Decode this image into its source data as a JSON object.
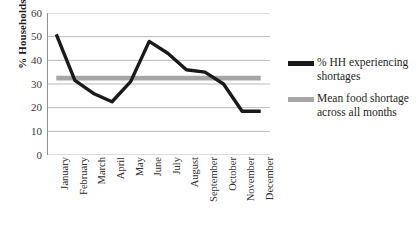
{
  "chart_data": {
    "type": "line",
    "title": "",
    "xlabel": "",
    "ylabel": "% Households",
    "ylim": [
      0,
      60
    ],
    "ytick_step": 10,
    "yticks": [
      60,
      50,
      40,
      30,
      20,
      10,
      0
    ],
    "grid": true,
    "legend_position": "right",
    "categories": [
      "January",
      "February",
      "March",
      "April",
      "May",
      "June",
      "July",
      "August",
      "September",
      "October",
      "November",
      "December"
    ],
    "series": [
      {
        "name": "% HH experiencing shortages",
        "color": "#1a1a1a",
        "values": [
          51,
          31.5,
          26,
          22.5,
          31,
          48,
          43,
          36,
          35,
          30,
          18.5,
          18.5
        ]
      },
      {
        "name": "Mean food shortage across all months",
        "color": "#a6a6a6",
        "values": [
          32.5,
          32.5,
          32.5,
          32.5,
          32.5,
          32.5,
          32.5,
          32.5,
          32.5,
          32.5,
          32.5,
          32.5
        ]
      }
    ]
  },
  "axes": {
    "y_title": "% Households",
    "y_tick_labels": [
      "60",
      "50",
      "40",
      "30",
      "20",
      "10",
      "0"
    ],
    "x_tick_labels": [
      "January",
      "February",
      "March",
      "April",
      "May",
      "June",
      "July",
      "August",
      "September",
      "October",
      "November",
      "December"
    ]
  },
  "legend": {
    "entries": [
      {
        "label": "% HH experiencing shortages",
        "color": "#1a1a1a",
        "swatch_name": "legend-swatch-households"
      },
      {
        "label": "Mean food shortage across all months",
        "color": "#a6a6a6",
        "swatch_name": "legend-swatch-mean"
      }
    ]
  },
  "colors": {
    "series_primary": "#1a1a1a",
    "series_mean": "#a6a6a6",
    "gridline": "#b9b9b9",
    "axis": "#8f8f8f",
    "text": "#231f20",
    "background": "#ffffff"
  }
}
